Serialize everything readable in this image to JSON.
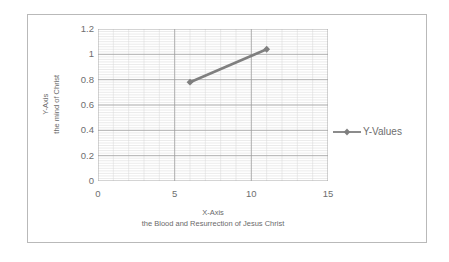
{
  "chart_data": {
    "type": "line",
    "title": "",
    "xlabel": "X-Axis",
    "xlabel_sub": "the Blood and Resurrection of Jesus Christ",
    "ylabel": "Y-Axis",
    "ylabel_sub": "the mind of Christ",
    "xlim": [
      0,
      15
    ],
    "ylim": [
      0,
      1.2
    ],
    "xticks": [
      "0",
      "5",
      "10",
      "15"
    ],
    "xtick_values": [
      0,
      5,
      10,
      15
    ],
    "yticks": [
      "0",
      "0.2",
      "0.4",
      "0.6",
      "0.8",
      "1",
      "1.2"
    ],
    "ytick_values": [
      0,
      0.2,
      0.4,
      0.6,
      0.8,
      1,
      1.2
    ],
    "grid": true,
    "grid_minor_x_step": 1,
    "grid_minor_y_step": 0.02,
    "legend_position": "right",
    "series": [
      {
        "name": "Y-Values",
        "color": "#7f7f7f",
        "marker": "diamond",
        "x": [
          6,
          11
        ],
        "values": [
          0.78,
          1.04
        ]
      }
    ]
  },
  "legend": {
    "entries": [
      {
        "label": "Y-Values",
        "color": "#7f7f7f"
      }
    ]
  },
  "colors": {
    "series": "#7f7f7f",
    "grid_major": "#9a9a9a",
    "grid_minor": "#d6d6d6",
    "axis_text": "#6e6e6e",
    "frame": "#b9b9b9"
  }
}
